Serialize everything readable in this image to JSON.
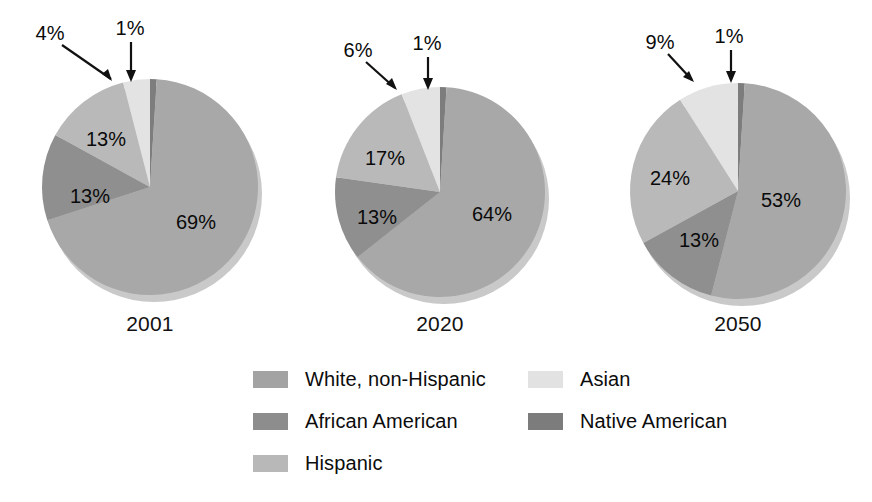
{
  "figure": {
    "background_color": "#ffffff"
  },
  "chart_data": {
    "type": "pie",
    "title": "",
    "subtitle": "",
    "xlabel": "",
    "ylabel": "",
    "grid": false,
    "legend_position": "bottom",
    "categories": [
      "White, non-Hispanic",
      "African American",
      "Hispanic",
      "Asian",
      "Native American"
    ],
    "colors": [
      "#a8a8a8",
      "#8f8f8f",
      "#b9b9b9",
      "#e3e3e3",
      "#7d7d7d"
    ],
    "charts": [
      {
        "label": "2001",
        "values": [
          69,
          13,
          13,
          4,
          1
        ],
        "value_labels": [
          "69%",
          "13%",
          "13%",
          "4%",
          "1%"
        ],
        "callouts": [
          "4%",
          "1%"
        ]
      },
      {
        "label": "2020",
        "values": [
          64,
          13,
          17,
          6,
          1
        ],
        "value_labels": [
          "64%",
          "13%",
          "17%",
          "6%",
          "1%"
        ],
        "callouts": [
          "6%",
          "1%"
        ]
      },
      {
        "label": "2050",
        "values": [
          53,
          13,
          24,
          9,
          1
        ],
        "value_labels": [
          "53%",
          "13%",
          "24%",
          "9%",
          "1%"
        ],
        "callouts": [
          "9%",
          "1%"
        ]
      }
    ]
  },
  "charts": [
    {
      "year": "2001",
      "slice_labels": [
        {
          "text": "69%",
          "x": 196,
          "y": 222
        },
        {
          "text": "13%",
          "x": 90,
          "y": 196
        },
        {
          "text": "13%",
          "x": 106,
          "y": 139
        }
      ],
      "callouts": [
        {
          "text": "4%",
          "x": 50,
          "y": 33
        },
        {
          "text": "1%",
          "x": 130,
          "y": 28
        }
      ]
    },
    {
      "year": "2020",
      "slice_labels": [
        {
          "text": "64%",
          "x": 492,
          "y": 214
        },
        {
          "text": "13%",
          "x": 377,
          "y": 217
        },
        {
          "text": "17%",
          "x": 385,
          "y": 158
        }
      ],
      "callouts": [
        {
          "text": "6%",
          "x": 358,
          "y": 50
        },
        {
          "text": "1%",
          "x": 427,
          "y": 43
        }
      ]
    },
    {
      "year": "2050",
      "slice_labels": [
        {
          "text": "53%",
          "x": 781,
          "y": 200
        },
        {
          "text": "13%",
          "x": 699,
          "y": 240
        },
        {
          "text": "24%",
          "x": 670,
          "y": 178
        }
      ],
      "callouts": [
        {
          "text": "9%",
          "x": 660,
          "y": 42
        },
        {
          "text": "1%",
          "x": 729,
          "y": 36
        }
      ]
    }
  ],
  "legend": {
    "columns": [
      {
        "items": [
          {
            "label": "White, non-Hispanic",
            "color": "#a3a3a3",
            "swatch_name": "legend-swatch-white-non-hispanic"
          },
          {
            "label": "African American",
            "color": "#8d8d8d",
            "swatch_name": "legend-swatch-african-american"
          },
          {
            "label": "Hispanic",
            "color": "#b8b8b8",
            "swatch_name": "legend-swatch-hispanic"
          }
        ]
      },
      {
        "items": [
          {
            "label": "Asian",
            "color": "#e2e2e2",
            "swatch_name": "legend-swatch-asian"
          },
          {
            "label": "Native American",
            "color": "#7c7c7c",
            "swatch_name": "legend-swatch-native-american"
          }
        ]
      }
    ]
  }
}
